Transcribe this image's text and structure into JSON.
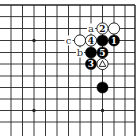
{
  "diagram": {
    "type": "go-board-corner",
    "corner": "top-right",
    "grid": {
      "x": [
        11,
        22.5,
        34,
        45.5,
        57,
        68.5,
        80,
        91,
        102.5,
        114,
        125,
        135
      ],
      "y": [
        5,
        16.6,
        28.5,
        40.5,
        52.5,
        64,
        76,
        87.5,
        99,
        110.5,
        122
      ],
      "top_edge": true,
      "right_edge": true
    },
    "hoshi": [
      {
        "col": 2,
        "row": 3
      },
      {
        "col": 8,
        "row": 3
      },
      {
        "col": 2,
        "row": 9
      },
      {
        "col": 8,
        "row": 9
      }
    ],
    "stones": [
      {
        "color": "white",
        "col": 8,
        "row": 2,
        "label": "2"
      },
      {
        "color": "white",
        "col": 9,
        "row": 2,
        "label": ""
      },
      {
        "color": "white",
        "col": 6,
        "row": 3,
        "label": ""
      },
      {
        "color": "white",
        "col": 7,
        "row": 3,
        "label": "4"
      },
      {
        "color": "black",
        "col": 8,
        "row": 3,
        "label": ""
      },
      {
        "color": "black",
        "col": 9,
        "row": 3,
        "label": "1"
      },
      {
        "color": "black",
        "col": 7,
        "row": 4,
        "label": ""
      },
      {
        "color": "black",
        "col": 8,
        "row": 4,
        "label": "5"
      },
      {
        "color": "black",
        "col": 7,
        "row": 5,
        "label": "3"
      },
      {
        "color": "white",
        "col": 8,
        "row": 5,
        "label": "",
        "marker": "triangle"
      },
      {
        "color": "black",
        "col": 8,
        "row": 7,
        "label": ""
      }
    ],
    "letters": [
      {
        "text": "a",
        "col": 7,
        "row": 2
      },
      {
        "text": "c",
        "col": 5,
        "row": 3
      },
      {
        "text": "b",
        "col": 6,
        "row": 4
      }
    ],
    "colors": {
      "line": "#222222",
      "black_stone": "#000000",
      "white_stone": "#ffffff",
      "background": "#ffffff"
    }
  }
}
